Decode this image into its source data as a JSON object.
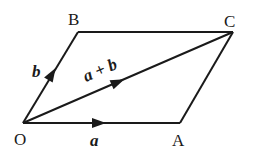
{
  "diagram": {
    "points": {
      "O": {
        "label": "O",
        "x": 23,
        "y": 123
      },
      "A": {
        "label": "A",
        "x": 180,
        "y": 123
      },
      "B": {
        "label": "B",
        "x": 78,
        "y": 32
      },
      "C": {
        "label": "C",
        "x": 233,
        "y": 32
      }
    },
    "vectors": [
      {
        "name": "a",
        "label": "a",
        "from": "O",
        "to": "A"
      },
      {
        "name": "b",
        "label": "b",
        "from": "O",
        "to": "B"
      },
      {
        "name": "a+b",
        "label": "a + b",
        "from": "O",
        "to": "C"
      }
    ],
    "segments": [
      {
        "from": "B",
        "to": "C"
      },
      {
        "from": "A",
        "to": "C"
      }
    ],
    "colors": {
      "line": "#1a1a1a",
      "background": "#ffffff"
    }
  }
}
